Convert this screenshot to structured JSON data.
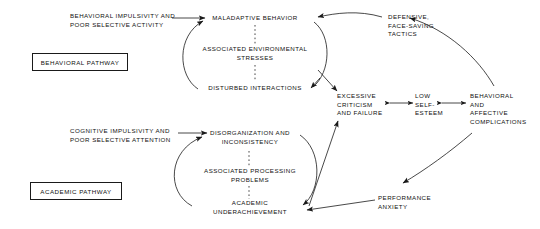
{
  "diagram": {
    "background_color": "#ffffff",
    "line_color": "#1a1a1a",
    "text_color": "#111111"
  },
  "pathway_labels": [
    {
      "id": "behavioral-pathway",
      "label": "BEHAVIORAL PATHWAY"
    },
    {
      "id": "academic-pathway",
      "label": "ACADEMIC PATHWAY"
    }
  ],
  "nodes": {
    "behavioral_input": "BEHAVIORAL IMPULSIVITY AND\nPOOR SELECTIVE ACTIVITY",
    "maladaptive_behavior": "MALADAPTIVE BEHAVIOR",
    "associated_environmental_stresses": "ASSOCIATED ENVIRONMENTAL\nSTRESSES",
    "disturbed_interactions": "DISTURBED INTERACTIONS",
    "defensive_tactics": "DEFENSIVE,\nFACE-SAVING\nTACTICS",
    "excessive_criticism": "EXCESSIVE\nCRITICISM\nAND FAILURE",
    "low_self_esteem": "LOW\nSELF-\nESTEEM",
    "behavioral_affective_complications": "BEHAVIORAL\nAND\nAFFECTIVE\nCOMPLICATIONS",
    "cognitive_input": "COGNITIVE IMPULSIVITY AND\nPOOR SELECTIVE ATTENTION",
    "disorganization": "DISORGANIZATION AND\nINCONSISTENCY",
    "associated_processing_problems": "ASSOCIATED PROCESSING\nPROBLEMS",
    "academic_underachievement": "ACADEMIC\nUNDERACHIEVEMENT",
    "performance_anxiety": "PERFORMANCE\nANXIETY"
  },
  "connections": [
    {
      "from": "behavioral_input",
      "to": "maladaptive_behavior",
      "style": "solid-arrow"
    },
    {
      "from": "maladaptive_behavior",
      "to": "associated_environmental_stresses",
      "style": "dashed"
    },
    {
      "from": "associated_environmental_stresses",
      "to": "disturbed_interactions",
      "style": "dashed"
    },
    {
      "from": "disturbed_interactions",
      "to": "maladaptive_behavior",
      "style": "curved-arrow"
    },
    {
      "from": "maladaptive_behavior",
      "to": "excessive_criticism",
      "style": "curved-arrow"
    },
    {
      "from": "defensive_tactics",
      "to": "maladaptive_behavior",
      "style": "curved-arrow"
    },
    {
      "from": "behavioral_affective_complications",
      "to": "defensive_tactics",
      "style": "curved-arrow"
    },
    {
      "from": "excessive_criticism",
      "to": "low_self_esteem",
      "style": "double-arrow"
    },
    {
      "from": "low_self_esteem",
      "to": "behavioral_affective_complications",
      "style": "double-arrow"
    },
    {
      "from": "cognitive_input",
      "to": "disorganization",
      "style": "solid-arrow"
    },
    {
      "from": "disorganization",
      "to": "associated_processing_problems",
      "style": "dashed"
    },
    {
      "from": "associated_processing_problems",
      "to": "academic_underachievement",
      "style": "dashed"
    },
    {
      "from": "academic_underachievement",
      "to": "disorganization",
      "style": "curved-arrow"
    },
    {
      "from": "disorganization",
      "to": "academic_underachievement",
      "style": "curved-arrow"
    },
    {
      "from": "academic_underachievement",
      "to": "excessive_criticism",
      "style": "straight-arrow"
    },
    {
      "from": "performance_anxiety",
      "to": "academic_underachievement",
      "style": "straight-arrow"
    },
    {
      "from": "behavioral_affective_complications",
      "to": "performance_anxiety",
      "style": "curved-arrow"
    }
  ]
}
